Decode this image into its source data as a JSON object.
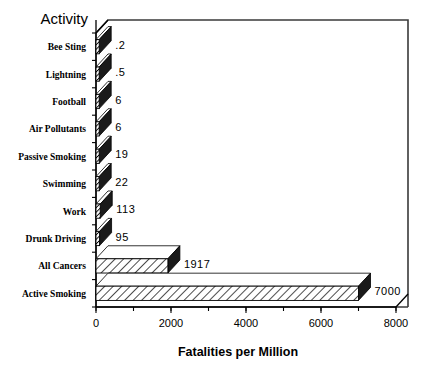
{
  "chart_data": {
    "type": "bar",
    "orientation": "horizontal",
    "title": "",
    "xlabel": "Fatalities per Million",
    "ylabel": "Activity",
    "categories": [
      "Bee Sting",
      "Lightning",
      "Football",
      "Air Pollutants",
      "Passive Smoking",
      "Swimming",
      "Work",
      "Drunk Driving",
      "All Cancers",
      "Active Smoking"
    ],
    "values": [
      0.2,
      0.5,
      6,
      6,
      19,
      22,
      113,
      95,
      1917,
      7000
    ],
    "value_labels": [
      ".2",
      ".5",
      "6",
      "6",
      "19",
      "22",
      "113",
      "95",
      "1917",
      "7000"
    ],
    "xlim": [
      0,
      8000
    ],
    "xticks": [
      0,
      2000,
      4000,
      6000,
      8000
    ],
    "xtick_labels": [
      "0",
      "2000",
      "4000",
      "6000",
      "8000"
    ],
    "minor_tick_interval": 1000,
    "grid": false,
    "legend": false,
    "style": "3d-hatched-bars",
    "colors": {
      "background": "#ffffff",
      "ink": "#000000",
      "bar_fill": "#ffffff",
      "bar_hatch": "#000000",
      "bar_cap": "#1a1a1a",
      "frame": "#3a3a3a"
    }
  }
}
